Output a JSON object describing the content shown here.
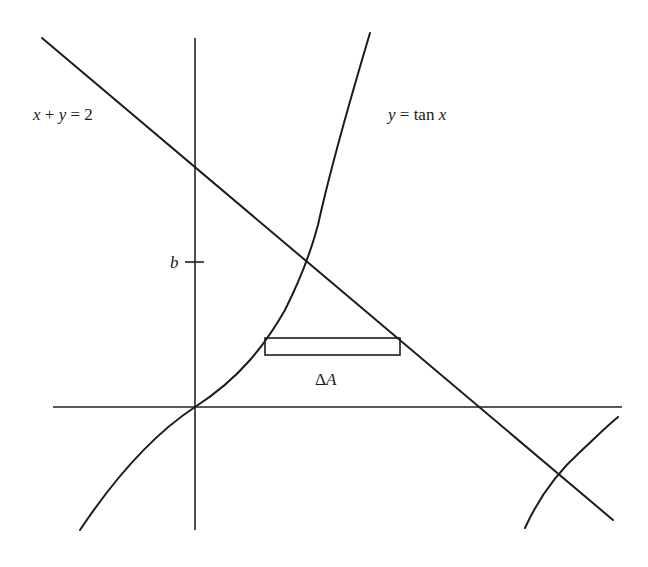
{
  "diagram": {
    "type": "area-between-curves",
    "labels": {
      "line": "x + y = 2",
      "line_parts": [
        "x",
        " + ",
        "y",
        " = 2"
      ],
      "curve": "y = tan x",
      "curve_parts": [
        "y",
        " = tan ",
        "x"
      ],
      "tick": "b",
      "strip": "ΔA",
      "strip_parts": [
        "Δ",
        "A"
      ]
    },
    "colors": {
      "ink": "#1c1c1c",
      "background": "#ffffff"
    },
    "elements": [
      "y-axis",
      "x-axis",
      "line x+y=2",
      "curve y=tan x (central branch)",
      "curve y=tan x (next branch)",
      "horizontal strip rectangle ΔA",
      "tick mark b on y-axis"
    ]
  }
}
